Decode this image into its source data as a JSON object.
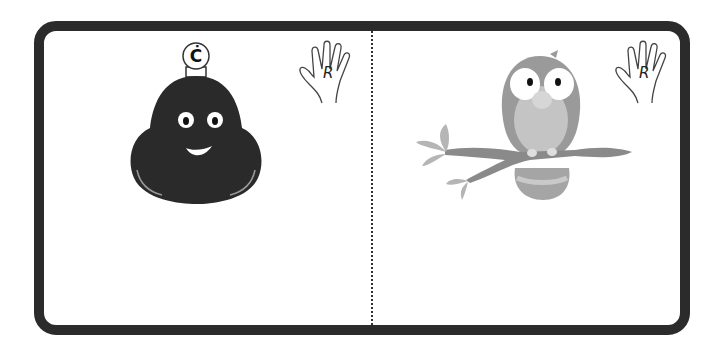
{
  "card": {
    "border_color": "#2b2b2b",
    "background": "#ffffff"
  },
  "left_panel": {
    "character": "dark-bell-shaped-blob-face",
    "badge_letter": "Ċ",
    "hand_letter": "R"
  },
  "right_panel": {
    "character": "owl-on-branch",
    "hand_letter": "R"
  },
  "colors": {
    "blob": "#2a2a2a",
    "owl_body": "#9a9a9a",
    "owl_belly": "#c4c4c4",
    "branch": "#8a8a8a",
    "leaves": "#b5b5b5"
  }
}
